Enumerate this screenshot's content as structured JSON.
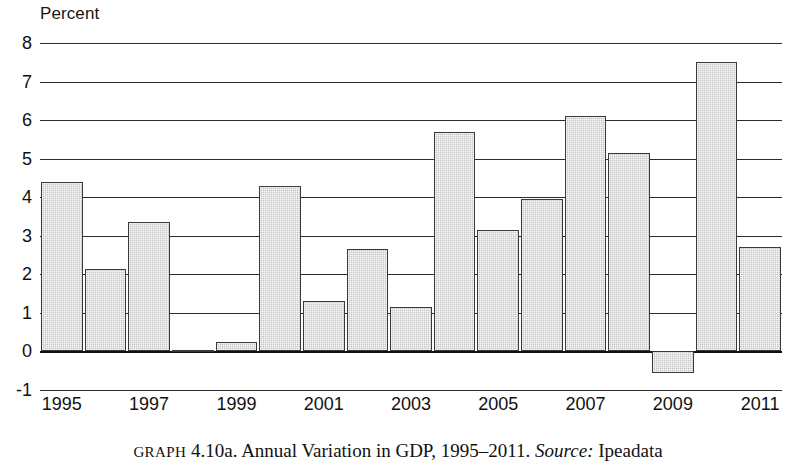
{
  "axis_title": "Percent",
  "caption": {
    "label": "GRAPH",
    "number": "4.10a.",
    "text": "Annual Variation in GDP, 1995–2011.",
    "source_label": "Source:",
    "source_value": "Ipeadata"
  },
  "colors": {
    "bar_fill": "#c6c6c6",
    "bar_stroke": "#3a3a3a",
    "gridline": "#2b2b2b",
    "text": "#111111"
  },
  "chart_data": {
    "type": "bar",
    "title": "Annual Variation in GDP, 1995–2011",
    "xlabel": "",
    "ylabel": "Percent",
    "ylim": [
      -1,
      8
    ],
    "yticks": [
      8,
      7,
      6,
      5,
      4,
      3,
      2,
      1,
      0,
      -1
    ],
    "ytick_labels": [
      "8",
      "7",
      "6",
      "5",
      "4",
      "3",
      "2",
      "1",
      "0",
      "-1"
    ],
    "xtick_labels": [
      "1995",
      "1997",
      "1999",
      "2001",
      "2003",
      "2005",
      "2007",
      "2009",
      "2011"
    ],
    "grid": true,
    "legend": "none",
    "source": "Ipeadata",
    "categories": [
      "1995",
      "1996",
      "1997",
      "1998",
      "1999",
      "2000",
      "2001",
      "2002",
      "2003",
      "2004",
      "2005",
      "2006",
      "2007",
      "2008",
      "2009",
      "2010",
      "2011"
    ],
    "values": [
      4.4,
      2.15,
      3.35,
      0.04,
      0.25,
      4.3,
      1.3,
      2.65,
      1.15,
      5.7,
      3.15,
      3.95,
      6.1,
      5.15,
      -0.55,
      7.5,
      2.7
    ]
  }
}
